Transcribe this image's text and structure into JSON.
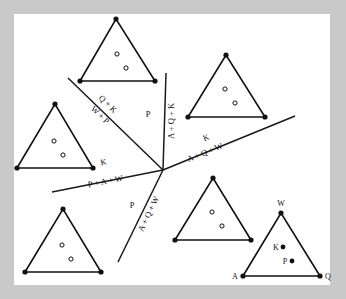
{
  "figure": {
    "background_color": "#ffffff",
    "frame_color": "#c9c9c9",
    "ink_color": "#111111",
    "canvas": {
      "x": 14,
      "y": 14,
      "width": 316,
      "height": 271
    },
    "center_point": {
      "x": 163,
      "y": 170
    }
  },
  "partition_lines": [
    {
      "name": "upper-left-diagonal",
      "x1": 68,
      "y1": 78,
      "x2": 163,
      "y2": 170,
      "labels": [
        {
          "key": "upper_left_outer",
          "text": "Q + K"
        },
        {
          "key": "upper_left_inner",
          "text": "W + P"
        }
      ]
    },
    {
      "name": "vertical-line",
      "x1": 166,
      "y1": 73,
      "x2": 163,
      "y2": 170,
      "labels": [
        {
          "key": "vertical_left",
          "text": "P"
        },
        {
          "key": "vertical_right",
          "text": "A + Q + K"
        }
      ]
    },
    {
      "name": "right-diagonal",
      "x1": 163,
      "y1": 170,
      "x2": 295,
      "y2": 116,
      "labels": [
        {
          "key": "right_above",
          "text": "K"
        },
        {
          "key": "right_below",
          "text": "A + Q + W"
        }
      ]
    },
    {
      "name": "left-shallow-line",
      "x1": 52,
      "y1": 192,
      "x2": 163,
      "y2": 170,
      "labels": [
        {
          "key": "left_above",
          "text": "K"
        },
        {
          "key": "left_below",
          "text": "P + A + W"
        }
      ]
    },
    {
      "name": "lower-left-diagonal",
      "x1": 163,
      "y1": 170,
      "x2": 118,
      "y2": 262,
      "labels": [
        {
          "key": "lower_left_outer",
          "text": "P"
        },
        {
          "key": "lower_left_inner",
          "text": "A + Q + W"
        }
      ]
    }
  ],
  "region_labels": {
    "upper_left_outer": "Q + K",
    "upper_left_inner": "W + P",
    "vertical_left": "P",
    "vertical_right": "A + Q + K",
    "right_above": "K",
    "right_below": "A + Q + W",
    "left_above": "K",
    "left_below": "P + A + W",
    "lower_left_outer": "P",
    "lower_left_inner": "A + Q + W"
  },
  "triangles": [
    {
      "name": "triangle-top",
      "apex": {
        "x": 116,
        "y": 19
      },
      "left": {
        "x": 80,
        "y": 81
      },
      "right": {
        "x": 155,
        "y": 81
      },
      "holes": [
        {
          "x": 117,
          "y": 54
        },
        {
          "x": 126,
          "y": 68
        }
      ],
      "vertex_labels": []
    },
    {
      "name": "triangle-upper-right",
      "apex": {
        "x": 226,
        "y": 55
      },
      "left": {
        "x": 188,
        "y": 117
      },
      "right": {
        "x": 265,
        "y": 117
      },
      "holes": [
        {
          "x": 225,
          "y": 89
        },
        {
          "x": 235,
          "y": 103
        }
      ],
      "vertex_labels": []
    },
    {
      "name": "triangle-left",
      "apex": {
        "x": 55,
        "y": 104
      },
      "left": {
        "x": 17,
        "y": 168
      },
      "right": {
        "x": 93,
        "y": 168
      },
      "holes": [
        {
          "x": 54,
          "y": 141
        },
        {
          "x": 63,
          "y": 155
        }
      ],
      "vertex_labels": []
    },
    {
      "name": "triangle-bottom-left",
      "apex": {
        "x": 63,
        "y": 209
      },
      "left": {
        "x": 25,
        "y": 272
      },
      "right": {
        "x": 101,
        "y": 272
      },
      "holes": [
        {
          "x": 62,
          "y": 245
        },
        {
          "x": 71,
          "y": 259
        }
      ],
      "vertex_labels": []
    },
    {
      "name": "triangle-bottom-middle",
      "apex": {
        "x": 213,
        "y": 178
      },
      "left": {
        "x": 175,
        "y": 240
      },
      "right": {
        "x": 251,
        "y": 240
      },
      "holes": [
        {
          "x": 212,
          "y": 212
        },
        {
          "x": 222,
          "y": 226
        }
      ],
      "vertex_labels": []
    },
    {
      "name": "triangle-labeled",
      "apex": {
        "x": 281,
        "y": 213
      },
      "left": {
        "x": 243,
        "y": 276
      },
      "right": {
        "x": 320,
        "y": 276
      },
      "holes": [],
      "interior_points": [
        {
          "label": "K",
          "x": 283,
          "y": 247
        },
        {
          "label": "P",
          "x": 292,
          "y": 261
        }
      ],
      "vertex_labels": [
        {
          "label": "W",
          "x": 281,
          "y": 204
        },
        {
          "label": "A",
          "x": 234,
          "y": 278
        },
        {
          "label": "Q",
          "x": 327,
          "y": 278
        }
      ]
    }
  ]
}
